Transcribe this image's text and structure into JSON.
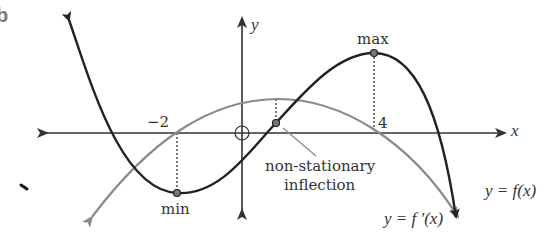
{
  "figure": {
    "part_label": "b",
    "axes": {
      "x_label": "x",
      "y_label": "y",
      "tick_labels": [
        "−2",
        "4"
      ]
    },
    "annotations": {
      "max": "max",
      "min": "min",
      "inflection_line1": "non-stationary",
      "inflection_line2": "inflection"
    },
    "curves": [
      {
        "name": "f",
        "label": "y = f(x)",
        "color": "#222222"
      },
      {
        "name": "f_prime",
        "label": "y = f ′(x)",
        "color": "#8a8a8a"
      }
    ],
    "key_points": {
      "min_x": -2,
      "max_x": 4,
      "inflection_x": 1
    }
  }
}
